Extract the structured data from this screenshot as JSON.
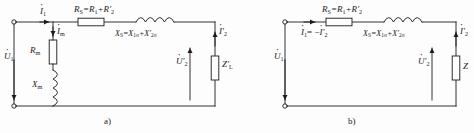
{
  "figure": {
    "ink_color": "#1b1b1b",
    "background": "#fdfdfd"
  },
  "circuit_a": {
    "caption": "a)",
    "source_voltage": "U",
    "source_voltage_sub": "1",
    "input_current": "I",
    "input_current_sub": "1",
    "magnetizing_current": "I",
    "magnetizing_current_sub": "m",
    "magnetizing_resistance": "R",
    "magnetizing_resistance_sub": "m",
    "magnetizing_reactance": "X",
    "magnetizing_reactance_sub": "m",
    "series_resistance_label": "R",
    "series_resistance_sub": "S",
    "series_resistance_expr": "=R",
    "series_resistance_expr_sub1": "1",
    "series_resistance_expr_mid": "+R",
    "series_resistance_expr_sub2": "2",
    "series_reactance_label": "X",
    "series_reactance_sub": "S",
    "series_reactance_expr": "=X",
    "series_reactance_expr_sub1": "1σ",
    "series_reactance_expr_mid": "+X",
    "series_reactance_expr_sub2": "2σ",
    "secondary_current": "I",
    "secondary_current_sub": "2",
    "secondary_voltage": "U",
    "secondary_voltage_sub": "2",
    "load_impedance": "Z",
    "load_impedance_sub": "L"
  },
  "circuit_b": {
    "caption": "b)",
    "source_voltage": "U",
    "source_voltage_sub": "1",
    "current_relation_left": "I",
    "current_relation_left_sub": "1",
    "current_relation_eq": "= −",
    "current_relation_right": "I",
    "current_relation_right_sub": "2",
    "series_resistance_label": "R",
    "series_resistance_sub": "S",
    "series_resistance_expr": "=R",
    "series_resistance_expr_sub1": "1",
    "series_resistance_expr_mid": "+R",
    "series_resistance_expr_sub2": "2",
    "series_reactance_label": "X",
    "series_reactance_sub": "S",
    "series_reactance_expr": "=X",
    "series_reactance_expr_sub1": "1σ",
    "series_reactance_expr_mid": "+X",
    "series_reactance_expr_sub2": "2σ",
    "secondary_current": "I",
    "secondary_current_sub": "2",
    "secondary_voltage": "U",
    "secondary_voltage_sub": "2",
    "load_impedance": "Z"
  }
}
